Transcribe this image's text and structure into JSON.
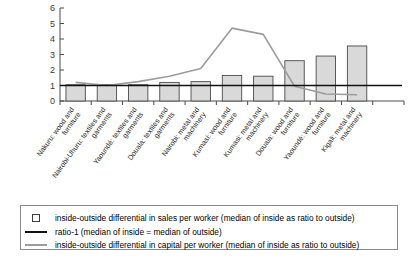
{
  "chart_data": {
    "type": "bar",
    "title": "",
    "subtitle": "",
    "xlabel": "",
    "ylabel": "",
    "ylim": [
      0,
      6
    ],
    "yticks": [
      0,
      1,
      2,
      3,
      4,
      5,
      6
    ],
    "grid": false,
    "legend_position": "bottom",
    "categories": [
      "Nakuru: wood and furniture",
      "Nairobi-Uhuru: textiles and garments",
      "Yaoundé: textiles and garments",
      "Douala: textiles and garments",
      "Nairobi: metal and machinery",
      "Kumasi: wood and furniture",
      "Kumasi: metal and machinery",
      "Douala: wood and furniture",
      "Yaoundé: wood and furniture",
      "Kigali: metal and machinery"
    ],
    "series": [
      {
        "name": "inside-outside differential in sales per worker (median of inside as ratio to outside)",
        "type": "bar",
        "color": "#d9d9d9",
        "edge_color": "#4a4a4a",
        "values": [
          1.05,
          1.05,
          1.05,
          1.2,
          1.25,
          1.65,
          1.6,
          2.6,
          2.9,
          3.55
        ]
      },
      {
        "name": "ratio-1 (median of inside = median of outside)",
        "type": "line",
        "color": "#111111",
        "values": [
          1,
          1,
          1,
          1,
          1,
          1,
          1,
          1,
          1,
          1
        ]
      },
      {
        "name": "inside-outside differential in capital per worker (median of inside as ratio to outside)",
        "type": "line",
        "color": "#9c9c9c",
        "values": [
          1.2,
          1.0,
          1.25,
          1.6,
          2.1,
          4.7,
          4.3,
          0.95,
          0.45,
          0.4
        ]
      }
    ]
  },
  "legend": {
    "entries": [
      {
        "marker": "square-outline-marker",
        "label": "inside-outside differential in sales per worker (median of inside as ratio to outside)"
      },
      {
        "marker": "black-line-marker",
        "label": "ratio-1 (median of inside = median of outside)"
      },
      {
        "marker": "gray-line-marker",
        "label": "inside-outside differential in capital per worker (median of inside as ratio to outside)"
      }
    ]
  }
}
